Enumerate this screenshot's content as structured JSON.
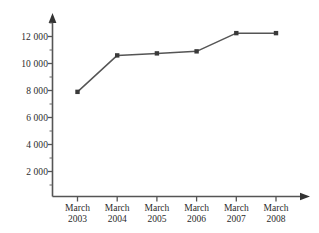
{
  "chart_data": {
    "type": "line",
    "title": "",
    "subtitle": "",
    "xlabel": "",
    "ylabel": "",
    "categories": [
      "March 2003",
      "March 2004",
      "March 2005",
      "March 2006",
      "March 2007",
      "March 2008"
    ],
    "category_lines": [
      {
        "month": "March",
        "year": "2003"
      },
      {
        "month": "March",
        "year": "2004"
      },
      {
        "month": "March",
        "year": "2005"
      },
      {
        "month": "March",
        "year": "2006"
      },
      {
        "month": "March",
        "year": "2007"
      },
      {
        "month": "March",
        "year": "2008"
      }
    ],
    "values": [
      7900,
      10600,
      10750,
      10900,
      12250,
      12250
    ],
    "series": [
      {
        "name": "",
        "values": [
          7900,
          10600,
          10750,
          10900,
          12250,
          12250
        ]
      }
    ],
    "ylim": [
      0,
      13000
    ],
    "xlim": [
      0,
      7
    ],
    "y_major_ticks": [
      2000,
      4000,
      6000,
      8000,
      10000,
      12000
    ],
    "y_minor_ticks": [
      1000,
      3000,
      5000,
      7000,
      9000,
      11000,
      13000
    ],
    "y_tick_labels": [
      "2 000",
      "4 000",
      "6 000",
      "8 000",
      "10 000",
      "12 000"
    ],
    "grid": false,
    "legend": false,
    "legend_position": "none",
    "marker": "square",
    "line_color": "#555555",
    "marker_color": "#3a3a3a",
    "axis_color": "#555555",
    "background_color": "#ffffff",
    "axis_arrows": [
      "x-right",
      "y-up"
    ],
    "annotations": []
  },
  "icons": {
    "x_axis_arrow": "arrow-right-icon",
    "y_axis_arrow": "arrow-up-icon"
  }
}
